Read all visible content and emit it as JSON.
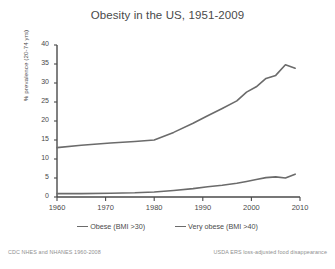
{
  "chart_data": {
    "type": "line",
    "title": "Obesity in the US, 1951-2009",
    "xlabel": "",
    "ylabel": "% prevalence (20-74 yrs)",
    "xlim": [
      1960,
      2010
    ],
    "ylim": [
      0,
      40
    ],
    "grid": false,
    "legend_position": "bottom",
    "xticks": [
      1960,
      1970,
      1980,
      1990,
      2000,
      2010
    ],
    "yticks": [
      0,
      5,
      10,
      15,
      20,
      25,
      30,
      35,
      40
    ],
    "xtick_labels": [
      "1960",
      "1970",
      "1980",
      "1990",
      "2000",
      "2010"
    ],
    "ytick_labels": [
      "0",
      "5",
      "10",
      "15",
      "20",
      "25",
      "30",
      "35",
      "40"
    ],
    "series": [
      {
        "name": "Obese (BMI >30)",
        "color": "#6b6b6b",
        "x": [
          1960,
          1965,
          1971,
          1976,
          1980,
          1984,
          1988,
          1991,
          1994,
          1997,
          1999,
          2001,
          2003,
          2005,
          2007,
          2009
        ],
        "values": [
          13.0,
          13.6,
          14.2,
          14.6,
          15.0,
          17.0,
          19.4,
          21.4,
          23.3,
          25.3,
          27.6,
          29.0,
          31.2,
          32.0,
          34.8,
          33.9
        ]
      },
      {
        "name": "Very obese (BMI >40)",
        "color": "#6b6b6b",
        "x": [
          1960,
          1965,
          1971,
          1976,
          1980,
          1984,
          1988,
          1991,
          1994,
          1997,
          1999,
          2001,
          2003,
          2005,
          2007,
          2009
        ],
        "values": [
          0.9,
          0.9,
          1.0,
          1.1,
          1.3,
          1.7,
          2.2,
          2.7,
          3.1,
          3.6,
          4.1,
          4.6,
          5.1,
          5.3,
          5.0,
          6.0
        ]
      }
    ]
  },
  "legend": {
    "items": [
      {
        "label": "Obese (BMI >30)"
      },
      {
        "label": "Very obese (BMI >40)"
      }
    ]
  },
  "footer": {
    "left_note": "CDC NHES and NHANES 1960-2008",
    "right_note": "USDA ERS loss-adjusted food disappearance"
  }
}
